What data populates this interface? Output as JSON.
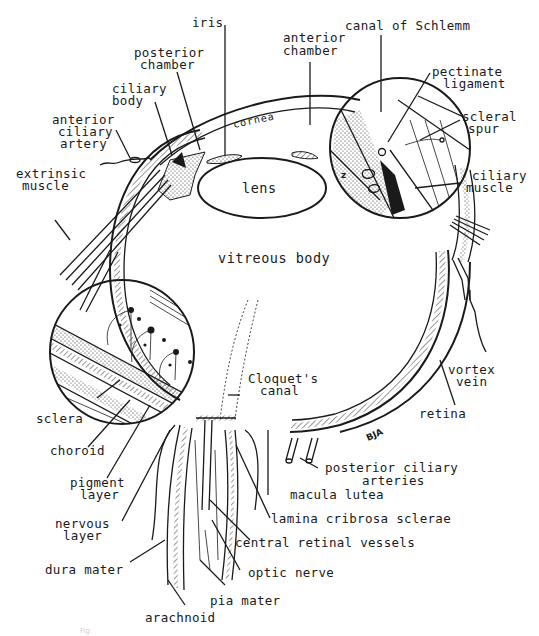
{
  "figure": {
    "signature": "BJA",
    "inset_marker": "z",
    "caption_faint": "Fig."
  },
  "labels": {
    "iris": "iris",
    "posterior_chamber_1": "posterior",
    "posterior_chamber_2": "chamber",
    "anterior_chamber_1": "anterior",
    "anterior_chamber_2": "chamber",
    "canal_of_schlemm": "canal  of  Schlemm",
    "pectinate_ligament_1": "pectinate",
    "pectinate_ligament_2": "ligament",
    "scleral_spur_1": "scleral",
    "scleral_spur_2": "spur",
    "ciliary_muscle_1": "ciliary",
    "ciliary_muscle_2": "muscle",
    "ciliary_body_1": "ciliary",
    "ciliary_body_2": "body",
    "anterior_ciliary_artery_1": "anterior",
    "anterior_ciliary_artery_2": "ciliary",
    "anterior_ciliary_artery_3": "artery",
    "extrinsic_muscle_1": "extrinsic",
    "extrinsic_muscle_2": "muscle",
    "cornea": "cornea",
    "lens": "lens",
    "vitreous_body": "vitreous body",
    "cloquets_canal_1": "Cloquet's",
    "cloquets_canal_2": "canal",
    "vortex_vein_1": "vortex",
    "vortex_vein_2": "vein",
    "retina": "retina",
    "sclera": "sclera",
    "choroid": "choroid",
    "pigment_layer_1": "pigment",
    "pigment_layer_2": "layer",
    "nervous_layer_1": "nervous",
    "nervous_layer_2": "layer",
    "posterior_ciliary_arteries_1": "posterior  ciliary",
    "posterior_ciliary_arteries_2": "arteries",
    "macula_lutea": "macula  lutea",
    "lamina_cribrosa_sclerae": "lamina  cribrosa sclerae",
    "central_retinal_vessels": "central  retinal  vessels",
    "optic_nerve": "optic  nerve",
    "dura_mater": "dura  mater",
    "pia_mater": "pia mater",
    "arachnoid": "arachnoid"
  },
  "colors": {
    "ink": "#1a1a1a",
    "paper": "#ffffff"
  }
}
